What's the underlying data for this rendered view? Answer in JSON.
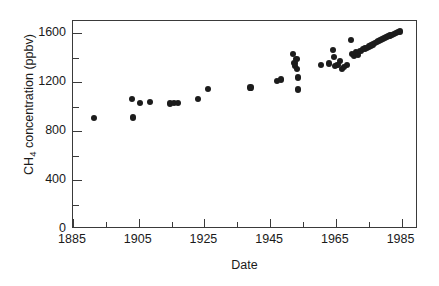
{
  "chart_data": {
    "type": "scatter",
    "title": "",
    "xlabel": "Date",
    "ylabel": "CH4 concentration (ppbv)",
    "ylabel_rich": {
      "prefix": "CH",
      "subscript": "4",
      "suffix": " concentration (ppbv)"
    },
    "xlim": [
      1885,
      1990
    ],
    "ylim": [
      0,
      1700
    ],
    "xticks_major": [
      1885,
      1905,
      1925,
      1945,
      1965,
      1985
    ],
    "xticks_minor": [
      1895,
      1915,
      1935,
      1955,
      1975
    ],
    "yticks_major": [
      0,
      400,
      800,
      1200,
      1600
    ],
    "yticks_minor": [
      200,
      600,
      1000,
      1400
    ],
    "xtick_labels": [
      "1885",
      "1905",
      "1925",
      "1945",
      "1965",
      "1985"
    ],
    "ytick_labels": [
      "0",
      "400",
      "800",
      "1200",
      "1600"
    ],
    "grid": false,
    "legend": false,
    "marker": "filled-circle",
    "marker_color": "#1c1c1c",
    "frame_color": "#3a3a3a",
    "background_color": "#ffffff",
    "series": [
      {
        "name": "CH4 concentration",
        "points": [
          [
            1891.5,
            905
          ],
          [
            1903.0,
            1060
          ],
          [
            1903.2,
            912
          ],
          [
            1905.5,
            1030
          ],
          [
            1908.5,
            1040
          ],
          [
            1914.5,
            1025
          ],
          [
            1915.8,
            1030
          ],
          [
            1917.0,
            1032
          ],
          [
            1923.0,
            1062
          ],
          [
            1926.0,
            1143
          ],
          [
            1939.0,
            1157
          ],
          [
            1947.2,
            1208
          ],
          [
            1948.2,
            1222
          ],
          [
            1952.0,
            1432
          ],
          [
            1952.4,
            1360
          ],
          [
            1952.6,
            1330
          ],
          [
            1953.0,
            1390
          ],
          [
            1953.2,
            1305
          ],
          [
            1953.4,
            1238
          ],
          [
            1953.6,
            1140
          ],
          [
            1960.5,
            1338
          ],
          [
            1963.0,
            1352
          ],
          [
            1964.2,
            1465
          ],
          [
            1964.5,
            1408
          ],
          [
            1964.8,
            1335
          ],
          [
            1965.5,
            1342
          ],
          [
            1966.2,
            1372
          ],
          [
            1966.8,
            1310
          ],
          [
            1967.5,
            1322
          ],
          [
            1968.5,
            1338
          ],
          [
            1969.5,
            1545
          ],
          [
            1969.8,
            1430
          ],
          [
            1970.5,
            1415
          ],
          [
            1971.2,
            1448
          ],
          [
            1971.8,
            1425
          ],
          [
            1972.5,
            1452
          ],
          [
            1973.2,
            1468
          ],
          [
            1973.8,
            1475
          ],
          [
            1974.4,
            1482
          ],
          [
            1975.0,
            1492
          ],
          [
            1975.6,
            1500
          ],
          [
            1976.2,
            1508
          ],
          [
            1976.8,
            1518
          ],
          [
            1977.4,
            1528
          ],
          [
            1978.0,
            1535
          ],
          [
            1978.6,
            1545
          ],
          [
            1979.2,
            1552
          ],
          [
            1979.8,
            1560
          ],
          [
            1980.4,
            1568
          ],
          [
            1981.0,
            1575
          ],
          [
            1981.6,
            1582
          ],
          [
            1982.2,
            1588
          ],
          [
            1982.8,
            1595
          ],
          [
            1983.4,
            1602
          ],
          [
            1984.0,
            1608
          ],
          [
            1984.6,
            1614
          ]
        ]
      }
    ]
  }
}
